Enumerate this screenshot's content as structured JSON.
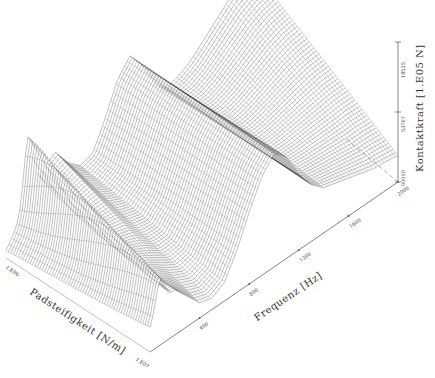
{
  "chart_data": {
    "type": "surface3d",
    "title": "",
    "axes": {
      "x": {
        "label": "Frequenz [Hz]",
        "ticks": [
          "400",
          "800",
          "1200",
          "1600",
          "2000"
        ],
        "range": [
          0,
          2000
        ]
      },
      "y": {
        "label": "Padsteifigkeit [N/m]",
        "ticks": [
          "1.E06",
          "1.E07"
        ],
        "range": [
          "1.E06",
          "1.E07"
        ],
        "scale": "log"
      },
      "z": {
        "label": "Kontaktkraft [1.E05 N]",
        "ticks": [
          "00000",
          "53767",
          "18535"
        ],
        "range": [
          0,
          1.8535
        ]
      }
    },
    "grid": false,
    "legend": null,
    "style": {
      "mesh_color": "#1a1a1a",
      "axis_color": "#555555",
      "dashed_axis": true
    },
    "surface_description": "Wireframe surface of contact force vs. frequency and pad stiffness: sharp ridge near low frequency/high stiffness edge, broad peak at mid frequencies (~600-900 Hz) rising to maximum, trough, second ridge near ~1200 Hz, flattening plateau toward 2000 Hz.",
    "profile_along_frequency": {
      "x": [
        0,
        100,
        200,
        300,
        400,
        500,
        600,
        700,
        800,
        900,
        1000,
        1100,
        1200,
        1300,
        1400,
        1500,
        1600,
        1700,
        1800,
        1900,
        2000
      ],
      "z_at_low_stiffness": [
        0.1,
        0.35,
        0.55,
        0.85,
        0.95,
        0.7,
        0.55,
        0.6,
        0.95,
        1.35,
        1.55,
        1.3,
        0.95,
        0.8,
        0.85,
        0.95,
        1.1,
        1.25,
        1.4,
        1.5,
        1.55
      ],
      "z_at_high_stiffness": [
        0.3,
        0.55,
        0.6,
        0.4,
        0.2,
        0.15,
        0.25,
        0.55,
        0.95,
        1.3,
        1.5,
        1.35,
        1.0,
        0.75,
        0.6,
        0.55,
        0.5,
        0.45,
        0.4,
        0.38,
        0.35
      ]
    }
  }
}
